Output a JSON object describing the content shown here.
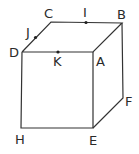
{
  "figure": {
    "vertices": [
      {
        "label": "A",
        "x": 93,
        "y": 52
      },
      {
        "label": "B",
        "x": 122,
        "y": 23
      },
      {
        "label": "C",
        "x": 51,
        "y": 22
      },
      {
        "label": "D",
        "x": 22,
        "y": 52
      },
      {
        "label": "E",
        "x": 93,
        "y": 128
      },
      {
        "label": "F",
        "x": 123,
        "y": 98
      },
      {
        "label": "H",
        "x": 21,
        "y": 128
      }
    ],
    "points": [
      {
        "label": "I",
        "x": 86,
        "y": 22
      },
      {
        "label": "J",
        "x": 35,
        "y": 37
      },
      {
        "label": "K",
        "x": 58,
        "y": 52
      }
    ],
    "labels": {
      "A": "A",
      "B": "B",
      "C": "C",
      "D": "D",
      "E": "E",
      "F": "F",
      "H": "H",
      "I": "I",
      "J": "J",
      "K": "K"
    }
  }
}
